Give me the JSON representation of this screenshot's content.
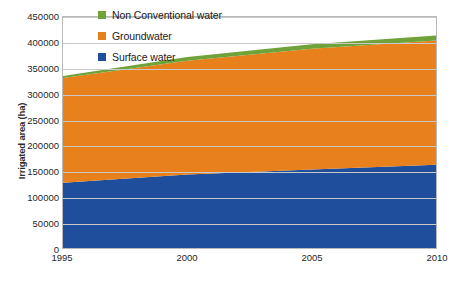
{
  "chart_data": {
    "type": "area",
    "stacked": true,
    "title": "",
    "xlabel": "",
    "ylabel": "Irrigated area (ha)",
    "x": [
      1995,
      2000,
      2005,
      2010
    ],
    "xlim": [
      1995,
      2010
    ],
    "ylim": [
      0,
      450000
    ],
    "xticks": [
      "1995",
      "2000",
      "2005",
      "2010"
    ],
    "yticks": [
      "0",
      "50000",
      "100000",
      "150000",
      "200000",
      "250000",
      "300000",
      "350000",
      "400000",
      "450000"
    ],
    "ytick_values": [
      0,
      50000,
      100000,
      150000,
      200000,
      250000,
      300000,
      350000,
      400000,
      450000
    ],
    "grid": true,
    "legend_position": "top-center-inside",
    "series": [
      {
        "name": "Surface water",
        "color": "#1F4E9C",
        "values": [
          127000,
          143000,
          153000,
          162000
        ]
      },
      {
        "name": "Groundwater",
        "color": "#E8801C",
        "values": [
          204000,
          222000,
          235000,
          242000
        ]
      },
      {
        "name": "Non Conventional water",
        "color": "#6FA33A",
        "values": [
          4000,
          7000,
          9000,
          10000
        ]
      }
    ],
    "cumulative_tops": {
      "surface_water": [
        127000,
        143000,
        153000,
        162000
      ],
      "groundwater": [
        331000,
        365000,
        388000,
        404000
      ],
      "non_conventional_water": [
        335000,
        372000,
        397000,
        414000
      ]
    }
  },
  "legend": {
    "items": [
      {
        "label": "Non Conventional water",
        "color": "#6FA33A"
      },
      {
        "label": "Groundwater",
        "color": "#E8801C"
      },
      {
        "label": "Surface water",
        "color": "#1F4E9C"
      }
    ]
  },
  "axes": {
    "y_title": "Irrigated area (ha)",
    "frame_color": "#b9b9b9",
    "grid_color": "#c9c9c9"
  }
}
